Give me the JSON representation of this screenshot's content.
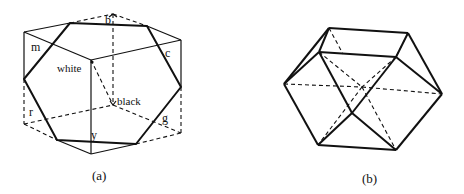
{
  "figure_a": {
    "caption": "(a)",
    "labels": {
      "b": "b",
      "m": "m",
      "c": "c",
      "r": "r",
      "g": "g",
      "y": "y",
      "white": "white",
      "black": "black"
    },
    "description": "RGB color cube with hexagonal cross-section; white and black corners joined by dashed diagonal"
  },
  "figure_b": {
    "caption": "(b)",
    "description": "Cuboctahedron-like polyhedron with dashed hidden edges"
  },
  "colors": {
    "stroke": "#111111",
    "background": "#ffffff"
  }
}
